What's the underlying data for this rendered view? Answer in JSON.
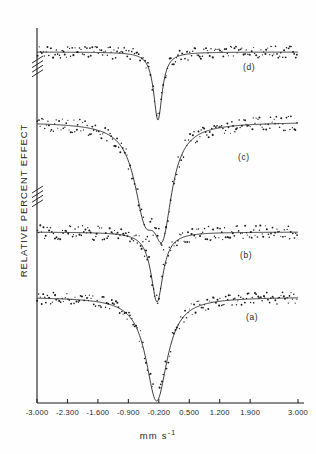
{
  "figure": {
    "ylabel": "RELATIVE PERCENT EFFECT",
    "xlabel_main": "mm s",
    "xlabel_sup": "-1",
    "background_color": "#fefefe",
    "ink_color": "#1a1a1a"
  },
  "axis": {
    "tick_labels": [
      "-3.000",
      "-2.300",
      "-1.600",
      "-0.900",
      "-0.200",
      "0.500",
      "1.200",
      "1.900",
      "3.000"
    ],
    "tick_values": [
      -3.0,
      -2.3,
      -1.6,
      -0.9,
      -0.2,
      0.5,
      1.2,
      1.9,
      3.0
    ]
  },
  "panels": [
    {
      "id": "d",
      "label": "(d)",
      "label_x": 243,
      "label_y": 62
    },
    {
      "id": "c",
      "label": "(c)",
      "label_x": 238,
      "label_y": 152
    },
    {
      "id": "b",
      "label": "(b)",
      "label_x": 240,
      "label_y": 250
    },
    {
      "id": "a",
      "label": "(a)",
      "label_x": 246,
      "label_y": 312
    }
  ],
  "chart_data": {
    "type": "line",
    "title": "",
    "xlabel": "mm s-1",
    "ylabel": "RELATIVE PERCENT EFFECT",
    "xlim": [
      -3.0,
      3.0
    ],
    "grid": false,
    "legend": "panel-labels-inside-right",
    "xticks": [
      -3.0,
      -2.3,
      -1.6,
      -0.9,
      -0.2,
      0.5,
      1.2,
      1.9,
      3.0
    ],
    "xtick_labels": [
      "-3.000",
      "-2.300",
      "-1.600",
      "-0.900",
      "-0.200",
      "0.500",
      "1.200",
      "1.900",
      "3.000"
    ],
    "y_axis_breaks": 2,
    "series": [
      {
        "name": "(d)",
        "baseline_y": 52,
        "noise_amplitude": 6,
        "point_count": 180,
        "peaks": [
          {
            "center": -0.22,
            "depth": 68,
            "halfwidth": 0.12
          }
        ]
      },
      {
        "name": "(c)",
        "baseline_y": 122,
        "noise_amplitude": 7,
        "point_count": 180,
        "peaks": [
          {
            "center": -0.52,
            "depth": 78,
            "halfwidth": 0.3
          },
          {
            "center": -0.11,
            "depth": 92,
            "halfwidth": 0.26
          }
        ]
      },
      {
        "name": "(b)",
        "baseline_y": 232,
        "noise_amplitude": 7,
        "point_count": 180,
        "peaks": [
          {
            "center": -0.24,
            "depth": 70,
            "halfwidth": 0.17
          }
        ]
      },
      {
        "name": "(a)",
        "baseline_y": 297,
        "noise_amplitude": 6,
        "point_count": 180,
        "peaks": [
          {
            "center": -0.25,
            "depth": 104,
            "halfwidth": 0.3
          }
        ]
      }
    ]
  }
}
